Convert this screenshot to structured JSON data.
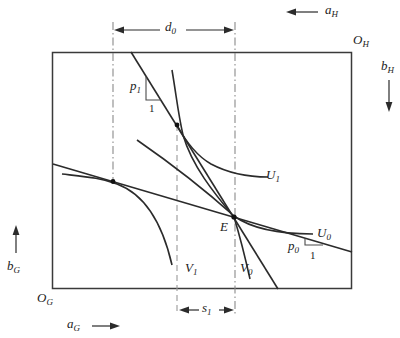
{
  "figure": {
    "type": "edgeworth-box-diagram",
    "background": "#ffffff",
    "line_color": "#2b2b2b",
    "guide_color": "#8a8a8a",
    "labels": {
      "aH": {
        "main": "a",
        "sub": "H"
      },
      "OH": {
        "main": "O",
        "sub": "H"
      },
      "bH": {
        "main": "b",
        "sub": "H"
      },
      "d0": {
        "main": "d",
        "sub": "0"
      },
      "p1": {
        "main": "p",
        "sub": "1"
      },
      "p1_unit": "1",
      "U1": {
        "main": "U",
        "sub": "1"
      },
      "U0": {
        "main": "U",
        "sub": "0"
      },
      "p0": {
        "main": "p",
        "sub": "0"
      },
      "p0_unit": "1",
      "E": "E",
      "V1": {
        "main": "V",
        "sub": "1"
      },
      "V0": {
        "main": "V",
        "sub": "0"
      },
      "bG": {
        "main": "b",
        "sub": "G"
      },
      "OG": {
        "main": "O",
        "sub": "G"
      },
      "aG": {
        "main": "a",
        "sub": "G"
      },
      "s1": {
        "main": "s",
        "sub": "1"
      }
    }
  }
}
